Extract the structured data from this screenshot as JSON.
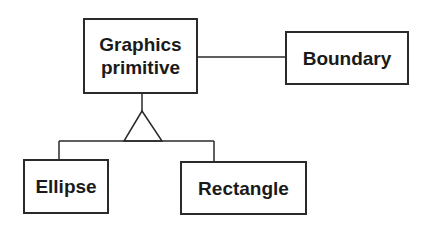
{
  "diagram": {
    "type": "class-diagram",
    "nodes": [
      {
        "id": "graphics_primitive",
        "label_line1": "Graphics",
        "label_line2": "primitive"
      },
      {
        "id": "boundary",
        "label": "Boundary"
      },
      {
        "id": "ellipse",
        "label": "Ellipse"
      },
      {
        "id": "rectangle",
        "label": "Rectangle"
      }
    ],
    "edges": [
      {
        "from": "graphics_primitive",
        "to": "boundary",
        "kind": "association"
      },
      {
        "from": "ellipse",
        "to": "graphics_primitive",
        "kind": "generalization"
      },
      {
        "from": "rectangle",
        "to": "graphics_primitive",
        "kind": "generalization"
      }
    ],
    "colors": {
      "stroke": "#2a2a2a",
      "text": "#1a1a1a",
      "background": "#ffffff"
    }
  }
}
